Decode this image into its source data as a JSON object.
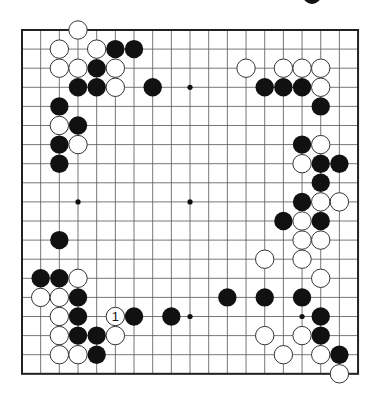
{
  "board": {
    "size": 19,
    "origin_x": 22,
    "origin_y": 30,
    "step_x": 18.67,
    "step_y": 19.1,
    "line_color": "#555555",
    "border_color": "#222222",
    "black_color": "#111111",
    "white_color": "#ffffff",
    "hoshi": [
      [
        9,
        3
      ],
      [
        3,
        9
      ],
      [
        9,
        9
      ],
      [
        9,
        15
      ],
      [
        15,
        15
      ]
    ],
    "black_stones": [
      [
        5,
        1
      ],
      [
        6,
        1
      ],
      [
        4,
        2
      ],
      [
        3,
        3
      ],
      [
        4,
        3
      ],
      [
        7,
        3
      ],
      [
        2,
        4
      ],
      [
        3,
        5
      ],
      [
        2,
        6
      ],
      [
        2,
        7
      ],
      [
        2,
        11
      ],
      [
        13,
        3
      ],
      [
        14,
        3
      ],
      [
        15,
        3
      ],
      [
        16,
        4
      ],
      [
        15,
        6
      ],
      [
        16,
        7
      ],
      [
        17,
        7
      ],
      [
        16,
        8
      ],
      [
        15,
        9
      ],
      [
        14,
        10
      ],
      [
        16,
        10
      ],
      [
        1,
        13
      ],
      [
        2,
        13
      ],
      [
        3,
        14
      ],
      [
        3,
        15
      ],
      [
        6,
        15
      ],
      [
        8,
        15
      ],
      [
        3,
        16
      ],
      [
        4,
        16
      ],
      [
        4,
        17
      ],
      [
        11,
        14
      ],
      [
        13,
        14
      ],
      [
        15,
        14
      ],
      [
        16,
        15
      ],
      [
        16,
        16
      ],
      [
        17,
        17
      ]
    ],
    "white_stones": [
      [
        3,
        0
      ],
      [
        2,
        1
      ],
      [
        4,
        1
      ],
      [
        2,
        2
      ],
      [
        3,
        2
      ],
      [
        5,
        2
      ],
      [
        5,
        3
      ],
      [
        2,
        5
      ],
      [
        3,
        6
      ],
      [
        12,
        2
      ],
      [
        14,
        2
      ],
      [
        15,
        2
      ],
      [
        16,
        2
      ],
      [
        16,
        3
      ],
      [
        16,
        6
      ],
      [
        15,
        7
      ],
      [
        16,
        9
      ],
      [
        17,
        9
      ],
      [
        15,
        10
      ],
      [
        15,
        11
      ],
      [
        16,
        11
      ],
      [
        13,
        12
      ],
      [
        15,
        12
      ],
      [
        16,
        13
      ],
      [
        3,
        13
      ],
      [
        1,
        14
      ],
      [
        2,
        14
      ],
      [
        2,
        15
      ],
      [
        2,
        16
      ],
      [
        5,
        16
      ],
      [
        2,
        17
      ],
      [
        3,
        17
      ],
      [
        13,
        16
      ],
      [
        15,
        16
      ],
      [
        14,
        17
      ],
      [
        16,
        17
      ],
      [
        17,
        18
      ]
    ],
    "labeled_stones": [
      {
        "col": 5,
        "row": 15,
        "color": "white",
        "label": "1"
      }
    ]
  },
  "caption": {
    "stone_color": "black",
    "text": ""
  }
}
